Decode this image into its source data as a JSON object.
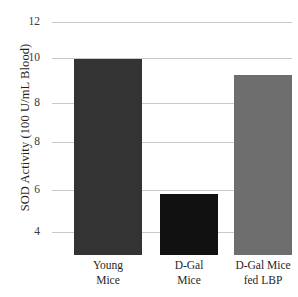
{
  "chart_data": {
    "type": "bar",
    "title": "",
    "xlabel": "",
    "ylabel": "SOD Activity (100 U/mL Blood)",
    "categories": [
      "Young Mice",
      "D-Gal Mice",
      "D-Gal Mice fed LBP"
    ],
    "category_lines": [
      [
        "Young",
        "Mice"
      ],
      [
        "D-Gal",
        "Mice"
      ],
      [
        "D-Gal Mice",
        "fed LBP"
      ]
    ],
    "values": [
      10.6,
      5.45,
      10.0
    ],
    "series": [
      {
        "name": "SOD Activity",
        "values": [
          10.6,
          5.45,
          10.0
        ]
      }
    ],
    "bar_colors": [
      "#333333",
      "#111111",
      "#6e6e6e"
    ],
    "ylim": [
      3.0,
      12.45
    ],
    "ytick_values": [
      12,
      10,
      8,
      8,
      6,
      4
    ],
    "ytick_labels": [
      "12",
      "10",
      "8",
      "8",
      "6",
      "4"
    ],
    "ytick_pixel_y": [
      8,
      44,
      89,
      128,
      176,
      218
    ],
    "grid": true,
    "grid_color": "#c9c9c9",
    "legend": "none"
  },
  "bar_layout": [
    {
      "left": 22,
      "width": 68
    },
    {
      "left": 108,
      "width": 58
    },
    {
      "left": 182,
      "width": 58
    }
  ],
  "category_layout": [
    {
      "left": 4,
      "width": 104
    },
    {
      "left": 92,
      "width": 90
    },
    {
      "left": 168,
      "width": 86
    }
  ]
}
